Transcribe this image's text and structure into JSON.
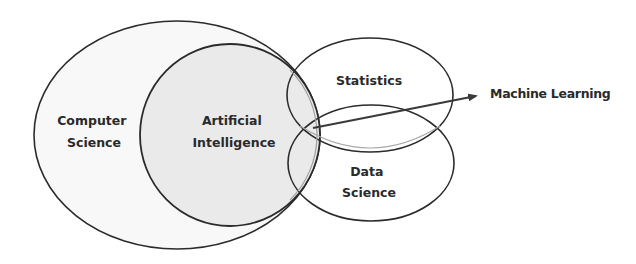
{
  "diagram": {
    "type": "venn",
    "sets": [
      {
        "id": "computer-science",
        "label_lines": [
          "Computer",
          "Science"
        ],
        "fill": "#f7f7f7"
      },
      {
        "id": "artificial-intelligence",
        "label_lines": [
          "Artificial",
          "Intelligence"
        ],
        "fill": "#e9e9e9"
      },
      {
        "id": "statistics",
        "label_lines": [
          "Statistics"
        ],
        "fill": "none"
      },
      {
        "id": "data-science",
        "label_lines": [
          "Data",
          "Science"
        ],
        "fill": "none"
      }
    ],
    "annotation": {
      "label": "Machine Learning",
      "points_to": "intersection of Artificial Intelligence, Statistics and Data Science"
    },
    "colors": {
      "outline": "#2b2b2b",
      "inner_outline": "#9a9a9a",
      "text": "#2a2a2a"
    }
  }
}
